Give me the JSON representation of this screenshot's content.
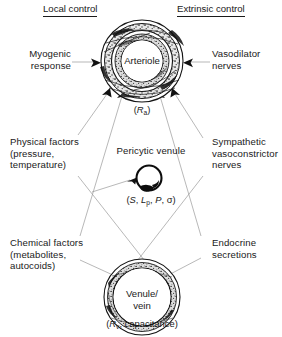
{
  "diagram": {
    "headers": {
      "left": "Local control",
      "right": "Extrinsic control"
    },
    "left_labels": [
      {
        "id": "myogenic",
        "text": "Myogenic\nresponse"
      },
      {
        "id": "physical",
        "text": "Physical factors\n(pressure,\ntemperature)"
      },
      {
        "id": "chemical",
        "text": "Chemical factors\n(metabolites,\nautocoids)"
      }
    ],
    "right_labels": [
      {
        "id": "vasodilator",
        "text": "Vasodilator\nnerves"
      },
      {
        "id": "sympathetic",
        "text": "Sympathetic\nvasoconstrictor\nnerves"
      },
      {
        "id": "endocrine",
        "text": "Endocrine\nsecretions"
      }
    ],
    "vessels": [
      {
        "id": "arteriole",
        "label": "Arteriole",
        "param_prefix": "(",
        "param_symbol": "R",
        "param_sub": "a",
        "param_suffix": ")"
      },
      {
        "id": "pericytic-venule",
        "label": "Pericytic venule",
        "param_text": "(S, Lp, P, σ)"
      },
      {
        "id": "venule-vein",
        "label": "Venule/\nvein",
        "param_prefix": "(",
        "param_symbol": "R",
        "param_sub": "v",
        "param_suffix": ", capacitance)"
      }
    ],
    "colors": {
      "ink": "#1a1a1a",
      "line": "#8a8a8a",
      "background": "#ffffff",
      "vessel_dark": "#2b2b2b"
    }
  }
}
